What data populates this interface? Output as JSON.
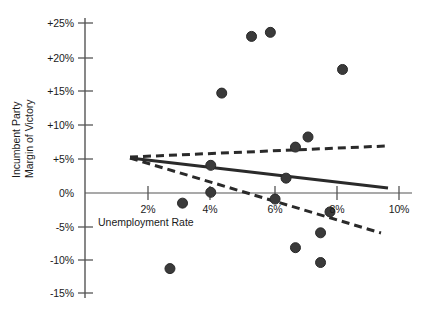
{
  "chart_data": {
    "type": "scatter",
    "title": "",
    "xlabel": "Unemployment Rate",
    "ylabel_lines": [
      "Incumbent Party",
      "Margin of Victory"
    ],
    "ylabel": "Incumbent Party Margin of Victory",
    "xlim": [
      0,
      10.6
    ],
    "ylim": [
      -16.5,
      26.5
    ],
    "xticks": [
      2,
      4,
      6,
      8,
      10
    ],
    "xtick_labels": [
      "2%",
      "4%",
      "6%",
      "8%",
      "10%"
    ],
    "yticks": [
      25,
      20,
      15,
      10,
      5,
      0,
      -5,
      -10,
      -15
    ],
    "ytick_labels": [
      "+25%",
      "+20%",
      "+15%",
      "+10%",
      "+5%",
      "0%",
      "-5%",
      "-10%",
      "-15%"
    ],
    "grid": false,
    "legend": null,
    "marker_color": "#3a3a3a",
    "marker_edge_color": "#2a2a2a",
    "marker_size_px": 10,
    "axis_color": "#4a4a4a",
    "points": [
      {
        "x": 5.3,
        "y": 23.2
      },
      {
        "x": 5.9,
        "y": 23.8
      },
      {
        "x": 8.2,
        "y": 18.3
      },
      {
        "x": 4.35,
        "y": 14.8
      },
      {
        "x": 7.1,
        "y": 8.3
      },
      {
        "x": 6.7,
        "y": 6.8
      },
      {
        "x": 4.0,
        "y": 4.1
      },
      {
        "x": 6.4,
        "y": 2.2
      },
      {
        "x": 4.0,
        "y": 0.1
      },
      {
        "x": 6.05,
        "y": -0.9
      },
      {
        "x": 3.1,
        "y": -1.5
      },
      {
        "x": 7.8,
        "y": -2.8
      },
      {
        "x": 7.5,
        "y": -5.9
      },
      {
        "x": 6.7,
        "y": -8.1
      },
      {
        "x": 7.5,
        "y": -10.3
      },
      {
        "x": 2.7,
        "y": -11.2
      }
    ],
    "fit_line": {
      "style": "solid",
      "color": "#2a2a2a",
      "x_start": 1.45,
      "y_start": 5.3,
      "x_end": 9.6,
      "y_end": 0.7
    },
    "confidence_upper": {
      "style": "dashed",
      "color": "#2a2a2a",
      "x_start": 1.45,
      "y_start": 5.4,
      "x_end": 9.5,
      "y_end": 7.0
    },
    "confidence_lower": {
      "style": "dashed",
      "color": "#2a2a2a",
      "x_start": 1.45,
      "y_start": 5.3,
      "x_end": 9.4,
      "y_end": -5.8
    }
  },
  "axes": {
    "x_axis_name": "unemployment-rate-axis",
    "y_axis_name": "incumbent-margin-axis"
  }
}
